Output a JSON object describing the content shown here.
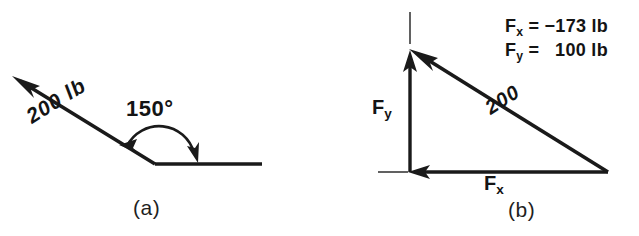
{
  "figure": {
    "background_color": "#ffffff",
    "ink_color": "#1a1a1a",
    "panels": [
      {
        "id": "a",
        "caption": "(a)",
        "type": "force-vector-diagram",
        "vector_label": "200 lb",
        "angle_label": "150°",
        "description": "Single 200 lb force vector directed up and to the left at 150 degrees from the positive x axis reference line."
      },
      {
        "id": "b",
        "caption": "(b)",
        "type": "component-triangle-diagram",
        "hypotenuse_label": "200",
        "vertical_component_label": "F",
        "vertical_component_sub": "y",
        "horizontal_component_label": "F",
        "horizontal_component_sub": "x",
        "description": "Right triangle showing the x and y components of the 200 lb force."
      }
    ],
    "equations": [
      {
        "symbol": "F",
        "subscript": "x",
        "operator": "=",
        "value": "−173",
        "unit": "lb",
        "text": "F_x = −173 lb"
      },
      {
        "symbol": "F",
        "subscript": "y",
        "operator": "=",
        "value": "100",
        "unit": "lb",
        "text": "F_y = 100 lb"
      }
    ],
    "equation_lines": {
      "fx_rest": " = −173 lb",
      "fy_rest": " =   100 lb"
    }
  }
}
